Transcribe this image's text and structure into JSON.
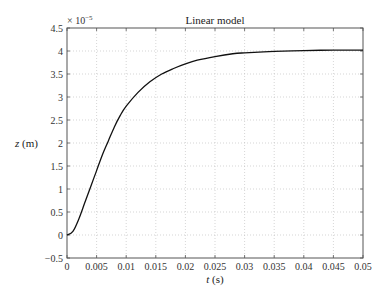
{
  "chart_data": {
    "type": "line",
    "title": "Linear model",
    "xlabel": "t (s)",
    "ylabel": "z (m)",
    "y_multiplier": "× 10^-5",
    "xlim": [
      0,
      0.05
    ],
    "ylim": [
      -0.5,
      4.5
    ],
    "xticks": [
      "0",
      "0.005",
      "0.01",
      "0.015",
      "0.02",
      "0.025",
      "0.03",
      "0.035",
      "0.04",
      "0.045",
      "0.05"
    ],
    "yticks": [
      "−0.5",
      "0",
      "0.5",
      "1",
      "1.5",
      "2",
      "2.5",
      "3",
      "3.5",
      "4",
      "4.5"
    ],
    "grid": true,
    "legend": null,
    "series": [
      {
        "name": "z",
        "color": "#111111",
        "x": [
          0,
          0.001,
          0.002,
          0.003,
          0.004,
          0.005,
          0.006,
          0.007,
          0.008,
          0.009,
          0.01,
          0.012,
          0.014,
          0.016,
          0.018,
          0.02,
          0.022,
          0.025,
          0.028,
          0.03,
          0.035,
          0.04,
          0.045,
          0.05
        ],
        "values": [
          0,
          0.08,
          0.35,
          0.7,
          1.05,
          1.4,
          1.75,
          2.05,
          2.35,
          2.6,
          2.8,
          3.1,
          3.33,
          3.5,
          3.62,
          3.72,
          3.8,
          3.88,
          3.94,
          3.96,
          3.99,
          4.01,
          4.02,
          4.02
        ]
      }
    ]
  }
}
